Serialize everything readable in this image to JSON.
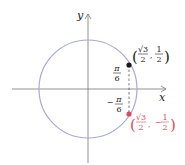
{
  "diagram": {
    "axes": {
      "x_label": "x",
      "y_label": "y"
    },
    "circle": {
      "cx": 88,
      "cy": 89,
      "r": 49,
      "color": "#a9a9d6"
    },
    "points": [
      {
        "name": "upper",
        "x": 129,
        "y": 65,
        "color": "#1a1a1a",
        "label": {
          "open": "(",
          "num1": "√3",
          "den1": "2",
          "sep": ",",
          "num2": "1",
          "den2": "2",
          "close": ")"
        }
      },
      {
        "name": "lower",
        "x": 129,
        "y": 114,
        "color": "#e0495a",
        "label": {
          "open": "(",
          "num1": "√3",
          "den1": "2",
          "sep": ",",
          "neg": "−",
          "num2": "1",
          "den2": "2",
          "close": ")"
        }
      }
    ],
    "angles": [
      {
        "num": "π",
        "den": "6"
      },
      {
        "neg": "−",
        "num": "π",
        "den": "6"
      }
    ]
  }
}
